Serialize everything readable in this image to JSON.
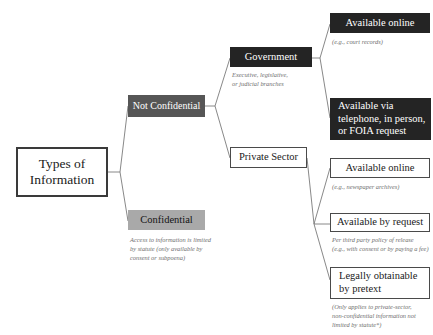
{
  "diagram": {
    "title": "Types of Information",
    "root": {
      "label": "Types of\nInformation"
    },
    "branches": [
      {
        "id": "not-confidential",
        "label": "Not Confidential",
        "style": "darkgrey"
      },
      {
        "id": "confidential",
        "label": "Confidential",
        "style": "grey",
        "caption": "Access to information is limited\nby statute (only available by\nconsent or subpoena)"
      }
    ],
    "sectors": [
      {
        "id": "government",
        "label": "Government",
        "style": "black",
        "caption": "Executive, legislative,\nor judicial branches"
      },
      {
        "id": "private-sector",
        "label": "Private Sector",
        "style": "outline",
        "caption": ""
      }
    ],
    "access_methods": [
      {
        "id": "gov-available-online",
        "label": "Available online",
        "style": "black",
        "caption": "(e.g., court records)"
      },
      {
        "id": "gov-telephone-foia",
        "label": "Available via\ntelephone, in person,\nor FOIA request",
        "style": "black",
        "caption": ""
      },
      {
        "id": "priv-available-online",
        "label": "Available online",
        "style": "outline",
        "caption": "(e.g., newspaper archives)"
      },
      {
        "id": "priv-available-by-request",
        "label": "Available by request",
        "style": "outline",
        "caption": "Per third party policy of release\n(e.g., with consent or by paying a fee)"
      },
      {
        "id": "priv-legally-obtainable-by-pretext",
        "label": "Legally obtainable\nby pretext",
        "style": "outline",
        "caption": "(Only applies to private-sector,\nnon-confidential information not\nlimited by statute*)"
      }
    ],
    "colors": {
      "black_box": "#242424",
      "dark_grey_box": "#565656",
      "grey_box": "#a9a9a9",
      "outline_border": "#4a4a4a",
      "root_border": "#3a3a3a",
      "connector_line": "#7a7a7a",
      "caption_text": "#6e6e6e",
      "background": "#ffffff"
    }
  }
}
